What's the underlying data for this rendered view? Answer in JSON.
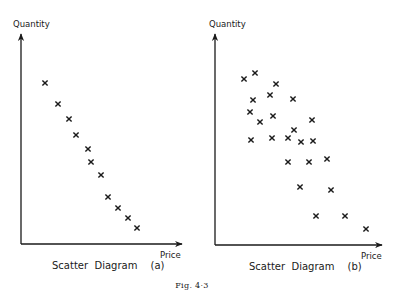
{
  "figure": {
    "label": "Fig. 4·3"
  },
  "chart_data": [
    {
      "type": "scatter",
      "title": "Scatter Diagram (a)",
      "xlabel": "Price",
      "ylabel": "Quantity",
      "grid": false,
      "legend": null,
      "marker": "x",
      "note": "Pixel coordinates of each x-marker (no numeric scale shown); strong negative relationship",
      "points": [
        [
          45,
          83
        ],
        [
          58,
          104
        ],
        [
          69,
          119
        ],
        [
          76,
          135
        ],
        [
          88,
          149
        ],
        [
          91,
          162
        ],
        [
          101,
          175
        ],
        [
          108,
          197
        ],
        [
          118,
          208
        ],
        [
          128,
          218
        ],
        [
          137,
          228
        ]
      ]
    },
    {
      "type": "scatter",
      "title": "Scatter Diagram (b)",
      "xlabel": "Price",
      "ylabel": "Quantity",
      "grid": false,
      "legend": null,
      "marker": "x",
      "note": "Pixel coordinates of each x-marker (no numeric scale shown); weak negative relationship",
      "points": [
        [
          244,
          79
        ],
        [
          255,
          73
        ],
        [
          276,
          84
        ],
        [
          253,
          100
        ],
        [
          270,
          95
        ],
        [
          293,
          99
        ],
        [
          250,
          112
        ],
        [
          260,
          122
        ],
        [
          273,
          116
        ],
        [
          312,
          120
        ],
        [
          294,
          130
        ],
        [
          251,
          140
        ],
        [
          272,
          138
        ],
        [
          288,
          138
        ],
        [
          301,
          142
        ],
        [
          313,
          141
        ],
        [
          288,
          162
        ],
        [
          309,
          162
        ],
        [
          327,
          159
        ],
        [
          300,
          187
        ],
        [
          331,
          190
        ],
        [
          316,
          216
        ],
        [
          345,
          216
        ],
        [
          366,
          229
        ]
      ]
    }
  ],
  "panels": {
    "a": {
      "ylabel": "Quantity",
      "xlabel": "Price",
      "caption_main": "Scatter  Diagram",
      "caption_tag": "(a)"
    },
    "b": {
      "ylabel": "Quantity",
      "xlabel": "Price",
      "caption_main": "Scatter  Diagram",
      "caption_tag": "(b)"
    }
  },
  "colors": {
    "ink": "#1a1a1a",
    "background": "#ffffff"
  }
}
